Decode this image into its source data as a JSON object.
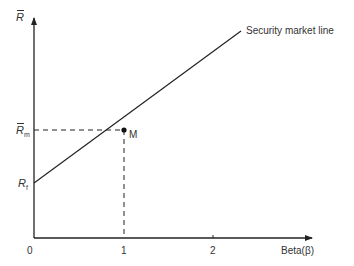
{
  "diagram": {
    "title": "Security market line",
    "y_axis_label": "R",
    "x_axis_label": "Beta(β)",
    "x_ticks": [
      "0",
      "1",
      "2"
    ],
    "points": {
      "market": {
        "label": "M",
        "y_label_base": "R",
        "y_label_sub": "m"
      },
      "risk_free": {
        "label_base": "R",
        "label_sub": "f"
      }
    },
    "line_label": "Security market line"
  }
}
